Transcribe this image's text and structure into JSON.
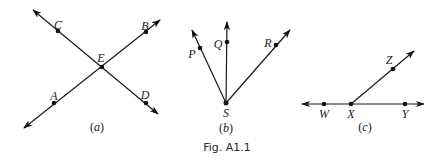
{
  "figure": {
    "caption": "Fig. A1.1",
    "colors": {
      "ink": "#1a1a1a",
      "background": "#ffffff"
    }
  },
  "panels": [
    {
      "id": "a",
      "label_open": "(",
      "label_letter": "a",
      "label_close": ")",
      "description": "Two intersecting lines AB and CD meeting at E",
      "lines": [
        {
          "name": "CD",
          "from": [
            33,
            10
          ],
          "to": [
            158,
            114
          ],
          "arrows": "both"
        },
        {
          "name": "AB",
          "from": [
            24,
            128
          ],
          "to": [
            160,
            20
          ],
          "arrows": "both"
        }
      ],
      "points": [
        {
          "name": "C",
          "x": 58,
          "y": 31,
          "lx": 58,
          "ly": 24
        },
        {
          "name": "B",
          "x": 146,
          "y": 32,
          "lx": 145,
          "ly": 25
        },
        {
          "name": "E",
          "x": 102,
          "y": 67,
          "lx": 101,
          "ly": 61
        },
        {
          "name": "A",
          "x": 54,
          "y": 103,
          "lx": 54,
          "ly": 96
        },
        {
          "name": "D",
          "x": 146,
          "y": 103,
          "lx": 145,
          "ly": 96
        }
      ]
    },
    {
      "id": "b",
      "label_open": "(",
      "label_letter": "b",
      "label_close": ")",
      "description": "Three rays SP, SQ, SR from common endpoint S",
      "rays": [
        {
          "name": "SP",
          "from": [
            226,
            103
          ],
          "to": [
            192,
            30
          ]
        },
        {
          "name": "SQ",
          "from": [
            226,
            103
          ],
          "to": [
            227,
            22
          ]
        },
        {
          "name": "SR",
          "from": [
            226,
            103
          ],
          "to": [
            290,
            30
          ]
        }
      ],
      "points": [
        {
          "name": "P",
          "x": 200,
          "y": 48,
          "lx": 191,
          "ly": 58
        },
        {
          "name": "Q",
          "x": 227,
          "y": 42,
          "lx": 218,
          "ly": 48
        },
        {
          "name": "R",
          "x": 276,
          "y": 45,
          "lx": 268,
          "ly": 47
        },
        {
          "name": "S",
          "x": 226,
          "y": 103,
          "lx": 226,
          "ly": 117
        }
      ]
    },
    {
      "id": "c",
      "label_open": "(",
      "label_letter": "c",
      "label_close": ")",
      "description": "Line WY with ray XZ from point X",
      "lines": [
        {
          "name": "WY",
          "from": [
            302,
            104
          ],
          "to": [
            424,
            104
          ],
          "arrows": "both"
        }
      ],
      "rays": [
        {
          "name": "XZ",
          "from": [
            351,
            104
          ],
          "to": [
            414,
            51
          ]
        }
      ],
      "points": [
        {
          "name": "Z",
          "x": 393,
          "y": 69,
          "lx": 389,
          "ly": 63
        },
        {
          "name": "W",
          "x": 324,
          "y": 104,
          "lx": 324,
          "ly": 118
        },
        {
          "name": "X",
          "x": 351,
          "y": 104,
          "lx": 351,
          "ly": 118
        },
        {
          "name": "Y",
          "x": 405,
          "y": 104,
          "lx": 405,
          "ly": 118
        }
      ]
    }
  ]
}
